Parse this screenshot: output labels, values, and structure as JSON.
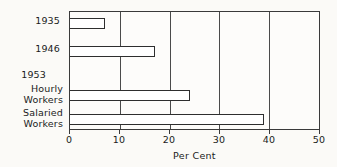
{
  "chart_data": {
    "type": "bar",
    "orientation": "horizontal",
    "title": "",
    "subtitle": "",
    "xlabel": "Per Cent",
    "ylabel": "",
    "categories": [
      "1935",
      "1946",
      "Hourly Workers",
      "Salaried Workers"
    ],
    "values": [
      7,
      17,
      24,
      39
    ],
    "group_headings": [
      {
        "label": "1953",
        "applies_to": [
          "Hourly Workers",
          "Salaried Workers"
        ]
      }
    ],
    "category_labels": [
      {
        "lines": [
          "1935"
        ],
        "value": 7
      },
      {
        "lines": [
          "1946"
        ],
        "value": 17
      },
      {
        "lines": [
          "Hourly",
          "Workers"
        ],
        "value": 24
      },
      {
        "lines": [
          "Salaried",
          "Workers"
        ],
        "value": 39
      }
    ],
    "xlim": [
      0,
      50
    ],
    "xticks": [
      0,
      10,
      20,
      30,
      40,
      50
    ],
    "xtick_labels": [
      "0",
      "10",
      "20",
      "30",
      "40",
      "50"
    ],
    "grid": true,
    "grid_axis": "x",
    "legend": false,
    "legend_position": "none",
    "bar_fill": "#ffffff",
    "bar_edge": "#2e2e2e",
    "frame_color": "#3a3a3a",
    "background": "#fbfaf7"
  },
  "axis": {
    "title": "Per Cent"
  },
  "labels": {
    "year_1935": "1935",
    "year_1946": "1946",
    "year_1953": "1953",
    "hourly_line1": "Hourly",
    "hourly_line2": "Workers",
    "salaried_line1": "Salaried",
    "salaried_line2": "Workers"
  },
  "ticks": {
    "t0": "0",
    "t10": "10",
    "t20": "20",
    "t30": "30",
    "t40": "40",
    "t50": "50"
  }
}
